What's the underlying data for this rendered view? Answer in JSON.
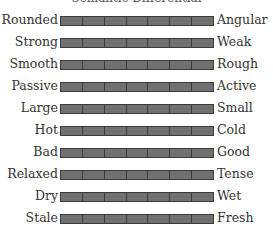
{
  "title": "Semantic Differential",
  "scale": {
    "points": 7,
    "cell_color": "#707070",
    "border_color": "#3c3c3c"
  },
  "rows": [
    {
      "left": "Rounded",
      "right": "Angular"
    },
    {
      "left": "Strong",
      "right": "Weak"
    },
    {
      "left": "Smooth",
      "right": "Rough"
    },
    {
      "left": "Passive",
      "right": "Active"
    },
    {
      "left": "Large",
      "right": "Small"
    },
    {
      "left": "Hot",
      "right": "Cold"
    },
    {
      "left": "Bad",
      "right": "Good"
    },
    {
      "left": "Relaxed",
      "right": "Tense"
    },
    {
      "left": "Dry",
      "right": "Wet"
    },
    {
      "left": "Stale",
      "right": "Fresh"
    }
  ]
}
